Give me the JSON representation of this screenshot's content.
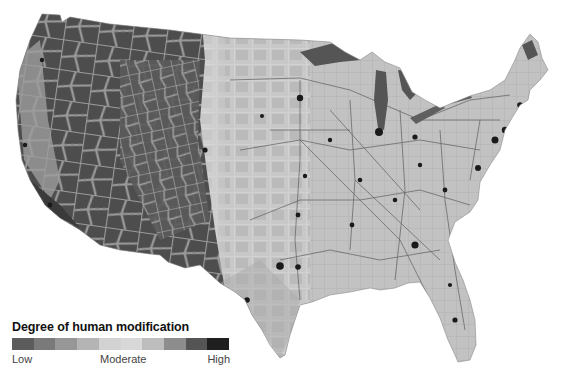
{
  "map": {
    "subject": "Contiguous United States",
    "encoding": "grayscale raster, dark = low or high modification extremes per legend"
  },
  "legend": {
    "title": "Degree of human modification",
    "labels": {
      "low": "Low",
      "moderate": "Moderate",
      "high": "High"
    },
    "swatches": [
      "#5c5c5c",
      "#7a7a7a",
      "#979797",
      "#b4b4b4",
      "#d2d2d2",
      "#d8d8d8",
      "#bdbdbd",
      "#8d8d8d",
      "#555555",
      "#1f1f1f"
    ]
  },
  "colors": {
    "west_background": "#6b6b6b",
    "west_patch_dark": "#4a4a4a",
    "west_road_network": "#9a9a9a",
    "plains": "#c9c9c9",
    "east": "#bcbcbc",
    "water_great_lakes": "#555555",
    "cities": "#1a1a1a",
    "roads": "#5a5a5a"
  }
}
